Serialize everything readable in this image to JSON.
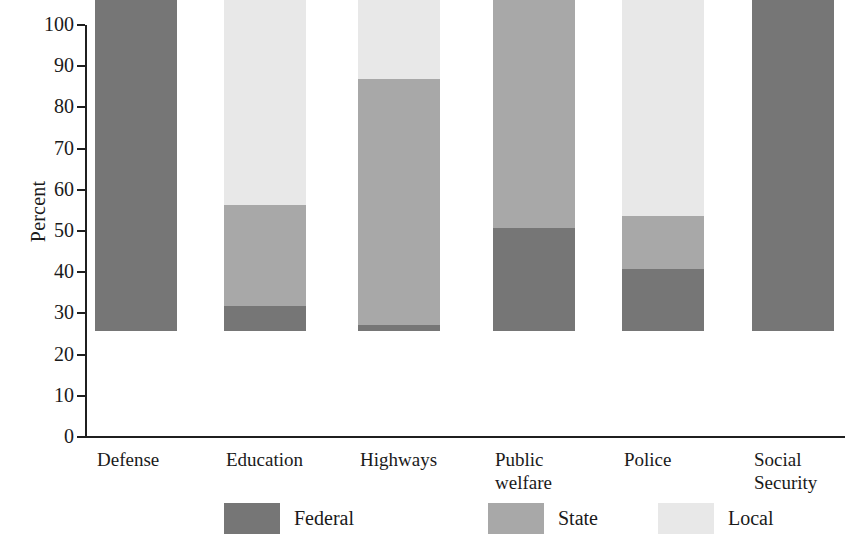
{
  "chart_data": {
    "type": "bar",
    "subtype": "stacked-bar-100-percent",
    "title": "",
    "xlabel": "",
    "ylabel": "Percent",
    "ylim": [
      0,
      100
    ],
    "yticks": [
      0,
      10,
      20,
      30,
      40,
      50,
      60,
      70,
      80,
      90,
      100
    ],
    "ytick_labels": [
      "0",
      "10",
      "20",
      "30",
      "40",
      "50",
      "60",
      "70",
      "80",
      "90",
      "100"
    ],
    "grid": false,
    "legend_position": "bottom",
    "categories": [
      "Defense",
      "Education",
      "Highways",
      "Public welfare",
      "Police",
      "Social Security"
    ],
    "category_labels_multiline": [
      "Defense",
      "Education",
      "Highways",
      "Public\nwelfare",
      "Police",
      "Social\nSecurity"
    ],
    "series": [
      {
        "name": "Federal",
        "color": "#767676",
        "values": [
          100,
          6,
          1.5,
          25,
          15,
          100
        ]
      },
      {
        "name": "State",
        "color": "#a8a8a8",
        "values": [
          0,
          24.5,
          59.7,
          58.5,
          13,
          0
        ]
      },
      {
        "name": "Local",
        "color": "#e8e8e8",
        "values": [
          0,
          69.5,
          38.8,
          16.5,
          72,
          0
        ]
      }
    ],
    "cumulative_tops": {
      "Defense": {
        "federal": 100,
        "state": 100,
        "local": 100
      },
      "Education": {
        "federal": 6,
        "state": 30.5,
        "local": 100
      },
      "Highways": {
        "federal": 1.5,
        "state": 61.2,
        "local": 100
      },
      "Public welfare": {
        "federal": 25,
        "state": 83.5,
        "local": 100
      },
      "Police": {
        "federal": 15,
        "state": 28,
        "local": 100
      },
      "Social Security": {
        "federal": 100,
        "state": 100,
        "local": 100
      }
    }
  },
  "legend": {
    "items": [
      {
        "label": "Federal",
        "color": "#767676"
      },
      {
        "label": "State",
        "color": "#a8a8a8"
      },
      {
        "label": "Local",
        "color": "#e8e8e8"
      }
    ]
  },
  "axis": {
    "y_title": "Percent"
  }
}
